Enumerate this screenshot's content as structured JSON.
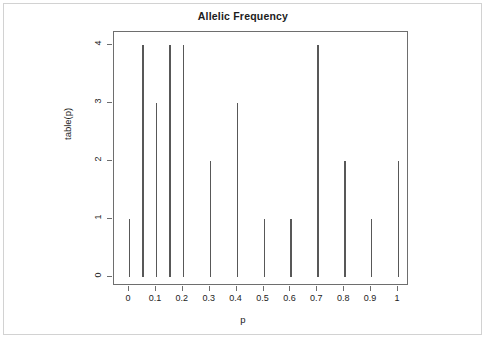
{
  "figure": {
    "title": "Allelic Frequency",
    "background_color": "#ffffff",
    "border_color": "#d2d2d2",
    "axis_color": "#6e6e6e",
    "spike_color": "#585858"
  },
  "chart_data": {
    "type": "bar",
    "title": "Allelic Frequency",
    "subtitle": "",
    "xlabel": "p",
    "ylabel": "table(p)",
    "xlim": [
      -0.02,
      1.02
    ],
    "ylim": [
      0,
      4
    ],
    "grid": false,
    "legend": "none",
    "style": "impulse/spike plot (R type=h)",
    "x": [
      0,
      0.05,
      0.1,
      0.15,
      0.2,
      0.3,
      0.4,
      0.5,
      0.6,
      0.7,
      0.8,
      0.9,
      1
    ],
    "values": [
      1,
      4,
      3,
      4,
      4,
      2,
      3,
      1,
      1,
      4,
      2,
      1,
      2
    ],
    "categories": [
      "0",
      "0.05",
      "0.1",
      "0.15",
      "0.2",
      "0.3",
      "0.4",
      "0.5",
      "0.6",
      "0.7",
      "0.8",
      "0.9",
      "1"
    ],
    "xticks": [
      0,
      0.1,
      0.2,
      0.3,
      0.4,
      0.5,
      0.6,
      0.7,
      0.8,
      0.9,
      1
    ],
    "xtick_labels": [
      "0",
      "0.1",
      "0.2",
      "0.3",
      "0.4",
      "0.5",
      "0.6",
      "0.7",
      "0.8",
      "0.9",
      "1"
    ],
    "yticks": [
      0,
      1,
      2,
      3,
      4
    ],
    "ytick_labels": [
      "0",
      "1",
      "2",
      "3",
      "4"
    ]
  }
}
